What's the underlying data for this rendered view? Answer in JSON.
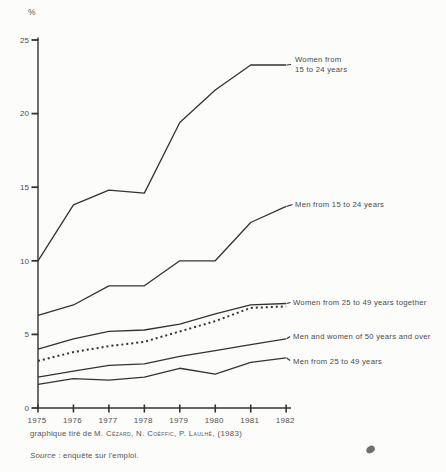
{
  "chart_data": {
    "type": "line",
    "title": "",
    "unit_label": "%",
    "categories": [
      "1975",
      "1976",
      "1977",
      "1978",
      "1979",
      "1980",
      "1981",
      "1982"
    ],
    "yticks": [
      0,
      5,
      10,
      15,
      20,
      25
    ],
    "ylim": [
      0,
      25
    ],
    "grid": false,
    "legend_position": "inline-annotations",
    "ink_color": "#333333",
    "tick_text_color": "#4f4f4f",
    "series": [
      {
        "name": "women-15-24",
        "label": "Women from 15 to 24 years",
        "label_lines": [
          "Women from",
          "15 to 24 years"
        ],
        "style": "solid",
        "values": [
          10.0,
          13.8,
          14.8,
          14.6,
          19.4,
          21.6,
          23.3,
          23.3
        ]
      },
      {
        "name": "men-15-24",
        "label": "Men from 15 to 24 years",
        "style": "solid",
        "values": [
          6.3,
          7.0,
          8.3,
          8.3,
          10.0,
          10.0,
          12.6,
          13.7
        ]
      },
      {
        "name": "women-25-49-solid",
        "label": "Women from 25 to 49 years together",
        "style": "solid",
        "values": [
          4.0,
          4.7,
          5.2,
          5.3,
          5.7,
          6.4,
          7.0,
          7.1
        ]
      },
      {
        "name": "women-25-49-dashed",
        "label": "Women from 25 to 49 years together",
        "style": "dashed",
        "values": [
          3.2,
          3.8,
          4.2,
          4.5,
          5.2,
          5.9,
          6.8,
          6.9
        ]
      },
      {
        "name": "men-women-50-and-over",
        "label": "Men and women of 50 years and over",
        "style": "solid",
        "values": [
          2.1,
          2.5,
          2.9,
          3.0,
          3.5,
          3.9,
          4.3,
          4.7
        ]
      },
      {
        "name": "men-25-49",
        "label": "Men from 25 to 49 years",
        "style": "solid",
        "values": [
          1.6,
          2.0,
          1.9,
          2.1,
          2.7,
          2.3,
          3.1,
          3.4
        ]
      }
    ]
  },
  "caption": {
    "prefix": "graphique tiré de",
    "authors": "M. Cézard, N. Coëffic, P. Laulhé, (1983)"
  },
  "source": {
    "prefix": "Source",
    "rest": " : enquête sur l'emploi."
  }
}
